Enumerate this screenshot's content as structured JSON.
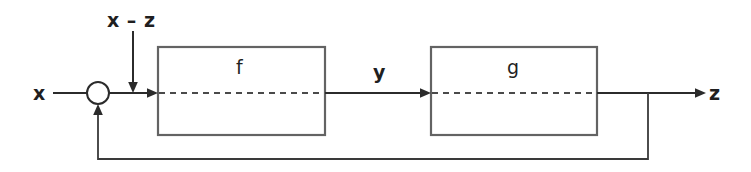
{
  "diagram": {
    "type": "block-diagram",
    "colors": {
      "background": "#ffffff",
      "block_border": "#636363",
      "signal_line": "#2b2b2b",
      "dashed_line": "#4a4a4a",
      "text": "#1f1f1f"
    },
    "blocks": [
      {
        "id": "f",
        "label": "f",
        "x": 158,
        "y": 47,
        "width": 167,
        "height": 88
      },
      {
        "id": "g",
        "label": "g",
        "x": 431,
        "y": 47,
        "width": 166,
        "height": 88
      }
    ],
    "nodes": [
      {
        "id": "summing-junction",
        "shape": "circle",
        "cx": 98,
        "cy": 93,
        "r": 11
      }
    ],
    "signals": [
      {
        "id": "input-x",
        "label": "x",
        "from": "external",
        "to": "summing-junction"
      },
      {
        "id": "error",
        "label": "x – z",
        "from": "summing-junction",
        "to": "f"
      },
      {
        "id": "intermediate-y",
        "label": "y",
        "from": "f",
        "to": "g"
      },
      {
        "id": "output-z",
        "label": "z",
        "from": "g",
        "to": "external"
      },
      {
        "id": "feedback",
        "label": "",
        "from": "output-z",
        "to": "summing-junction"
      }
    ],
    "labels": {
      "input": "x",
      "error": "x – z",
      "block_f": "f",
      "intermediate": "y",
      "block_g": "g",
      "output": "z"
    }
  }
}
